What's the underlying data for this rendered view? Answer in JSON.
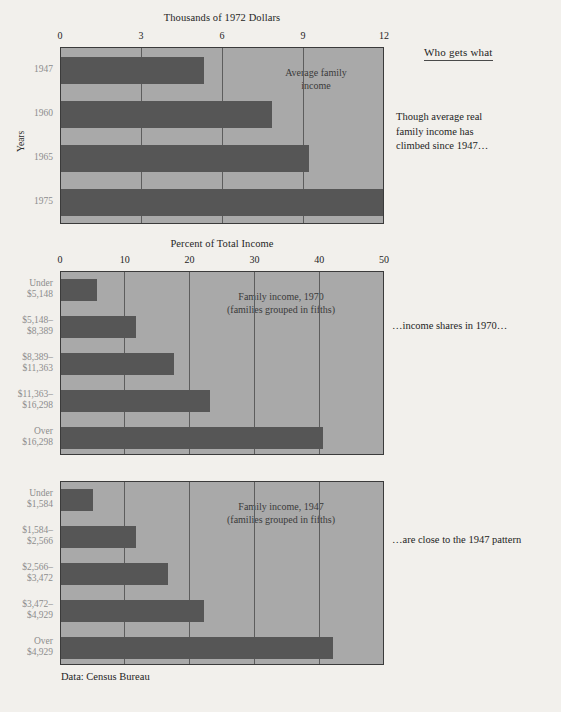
{
  "figure": {
    "rail_heading": "Who gets what",
    "source": "Data: Census Bureau",
    "accent_bar_color": "#565656",
    "plot_background_color": "#a9a9a9",
    "page_background_color": "#f2f0ec"
  },
  "rail_notes": {
    "top": "Though average real\nfamily income has\nclimbed since 1947…",
    "middle": "…income shares in 1970…",
    "bottom": "…are close to the 1947 pattern"
  },
  "chart_data": [
    {
      "type": "bar",
      "orientation": "horizontal",
      "title": "Thousands of 1972 Dollars",
      "xlabel": "Thousands of 1972 Dollars",
      "ylabel": "Years",
      "annotation": "Average family\nincome",
      "categories": [
        "1947",
        "1960",
        "1965",
        "1975"
      ],
      "values": [
        5.3,
        7.8,
        9.2,
        12.0
      ],
      "xlim": [
        0,
        12
      ],
      "xticks": [
        0,
        3,
        6,
        9,
        12
      ],
      "xticklabels": [
        "0",
        "3",
        "6",
        "9",
        "12"
      ],
      "grid": true,
      "legend": "none"
    },
    {
      "type": "bar",
      "orientation": "horizontal",
      "title": "Percent of Total Income",
      "xlabel": "Percent of Total Income",
      "ylabel": "",
      "annotation": "Family income, 1970\n(families grouped in fifths)",
      "categories": [
        "Under\n$5,148",
        "$5,148–\n$8,389",
        "$8,389–\n$11,363",
        "$11,363–\n$16,298",
        "Over\n$16,298"
      ],
      "values": [
        5.5,
        11.5,
        17.5,
        23.0,
        40.5
      ],
      "xlim": [
        0,
        50
      ],
      "xticks": [
        0,
        10,
        20,
        30,
        40,
        50
      ],
      "xticklabels": [
        "0",
        "10",
        "20",
        "30",
        "40",
        "50"
      ],
      "grid": true,
      "legend": "none"
    },
    {
      "type": "bar",
      "orientation": "horizontal",
      "title": "",
      "xlabel": "",
      "ylabel": "",
      "annotation": "Family income, 1947\n(families grouped in fifths)",
      "categories": [
        "Under\n$1,584",
        "$1,584–\n$2,566",
        "$2,566–\n$3,472",
        "$3,472–\n$4,929",
        "Over\n$4,929"
      ],
      "values": [
        5.0,
        11.5,
        16.5,
        22.0,
        42.0
      ],
      "xlim": [
        0,
        50
      ],
      "xticks": [
        0,
        10,
        20,
        30,
        40,
        50
      ],
      "xticklabels": [
        "0",
        "10",
        "20",
        "30",
        "40",
        "50"
      ],
      "grid": true,
      "legend": "none"
    }
  ]
}
